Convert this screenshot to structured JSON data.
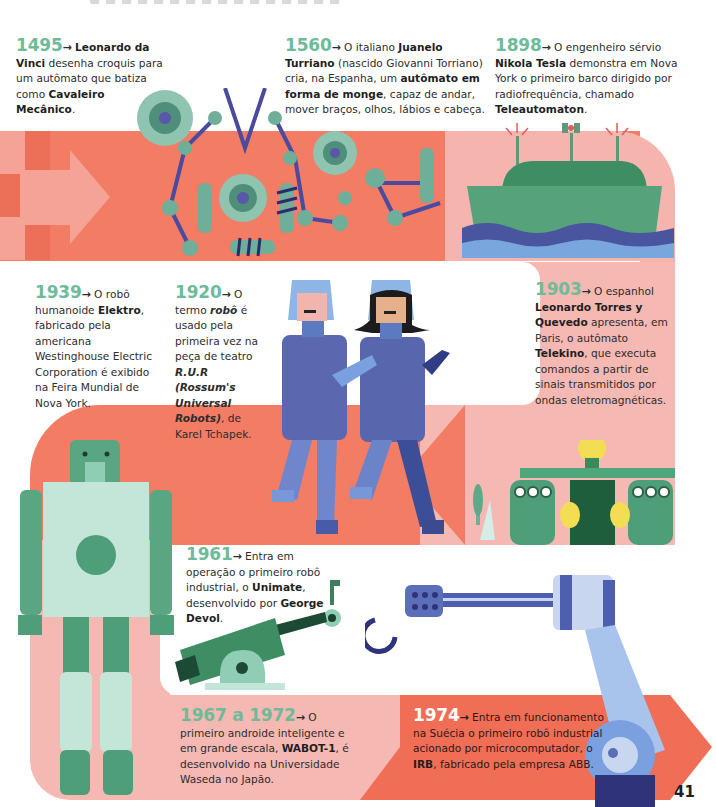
{
  "page": {
    "page_number": "41",
    "colors": {
      "red": "#f27c64",
      "pink": "#f6b8b3",
      "year_green": "#6dbb98",
      "robot_green": "#4f9e7a",
      "robot_light": "#c4e6d8",
      "blue": "#5a6fb7",
      "navy": "#2f347a"
    }
  },
  "entries": {
    "e1495": {
      "year": "1495",
      "arrow": "→",
      "parts": [
        "Leonardo da Vinci",
        " desenha croquis para um autômato que batiza como ",
        "Cavaleiro Mecânico",
        "."
      ]
    },
    "e1560": {
      "year": "1560",
      "arrow": "→",
      "parts": [
        " O italiano ",
        "Juanelo Turriano",
        " (nascido Giovanni Torriano) cria, na Espanha, um ",
        "autômato em forma de monge",
        ", capaz de andar, mover braços, olhos, lábios e cabeça."
      ]
    },
    "e1898": {
      "year": "1898",
      "arrow": "→",
      "parts": [
        " O engenheiro sérvio ",
        "Nikola Tesla",
        " demonstra em Nova York o primeiro barco dirigido por radiofrequência, chamado ",
        "Teleautomaton",
        "."
      ]
    },
    "e1939": {
      "year": "1939",
      "arrow": "→",
      "parts": [
        " O robô humanoide ",
        "Elektro",
        ", fabricado pela americana Westinghouse Electric Corporation é exibido na Feira Mundial de Nova York."
      ]
    },
    "e1920": {
      "year": "1920",
      "arrow": "→",
      "parts": [
        " O termo ",
        "robô",
        " é usado pela primeira vez na peça de teatro ",
        "R.U.R (Rossum's Universal Robots)",
        ", de Karel Tchapek."
      ]
    },
    "e1903": {
      "year": "1903",
      "arrow": "→",
      "parts": [
        " O espanhol ",
        "Leonardo Torres y Quevedo",
        " apresenta, em Paris, o autômato ",
        "Telekino",
        ", que executa comandos a partir de sinais transmitidos por ondas eletromagnéticas."
      ]
    },
    "e1961": {
      "year": "1961",
      "arrow": "→",
      "parts": [
        " Entra em operação o primeiro robô industrial, o ",
        "Unimate",
        ", desenvolvido por ",
        "George Devol",
        "."
      ]
    },
    "e1967": {
      "year": "1967 a 1972",
      "arrow": "→",
      "parts": [
        " O primeiro androide inteligente e em grande escala, ",
        "WABOT-1",
        ", é desenvolvido na Universidade Waseda no Japão."
      ]
    },
    "e1974": {
      "year": "1974",
      "arrow": "→",
      "parts": [
        " Entra em funcionamento na Suécia o primeiro robô industrial acionado por microcomputador, o ",
        "IRB",
        ", fabricado pela empresa ABB."
      ]
    }
  },
  "illustrations": {
    "gears_automaton": "gears-and-pulleys-illustration",
    "ship": "radio-controlled-boat-illustration",
    "robots_rur": "two-actors-robot-costumes-illustration",
    "telekino": "telekino-machine-illustration",
    "elektro": "elektro-humanoid-robot-illustration",
    "unimate": "unimate-industrial-arm-illustration",
    "irb": "irb-industrial-robot-arm-illustration"
  }
}
